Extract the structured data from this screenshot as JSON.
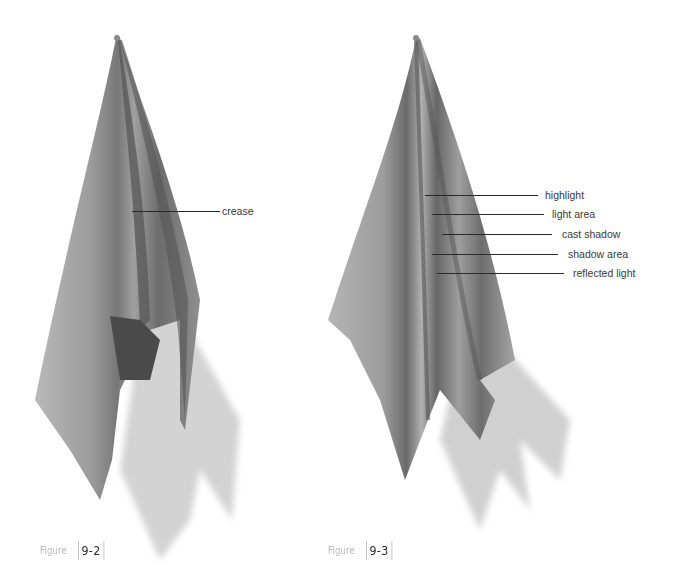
{
  "figures": [
    {
      "id": "9-2",
      "caption_word": "Figure",
      "caption_number": "9-2",
      "subject": "cloth hanging from a single point with a crease",
      "labels": [
        {
          "text": "crease"
        }
      ]
    },
    {
      "id": "9-3",
      "caption_word": "Figure",
      "caption_number": "9-3",
      "subject": "cloth hanging from a single point showing value areas",
      "labels": [
        {
          "text": "highlight"
        },
        {
          "text": "light area"
        },
        {
          "text": "cast shadow"
        },
        {
          "text": "shadow area"
        },
        {
          "text": "reflected light"
        }
      ]
    }
  ],
  "colors": {
    "background": "#ffffff",
    "cloth_light": "#a8a8a8",
    "cloth_mid": "#8a8a8a",
    "cloth_dark": "#5e5e5e",
    "shadow": "#cfcfcf",
    "caption_word": "#b9b9b9",
    "caption_number": "#2b2b2b",
    "label_text": "#3a3a3a"
  }
}
